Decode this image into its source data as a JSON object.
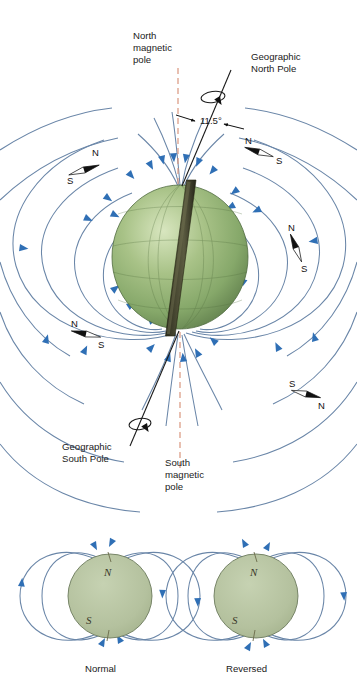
{
  "figure": {
    "title_visible": false,
    "background_color": "#ffffff",
    "colors": {
      "field_line": "#6a86a8",
      "field_arrow": "#2f6fb5",
      "magnetic_axis_dashed": "#d9967e",
      "geographic_axis": "#1a1a1a",
      "earth_green_light": "#cfe0b4",
      "earth_green_mid": "#8fb072",
      "earth_green_dark": "#5d7b4b",
      "bar_magnet_dark": "#3a3a28",
      "bar_magnet_light": "#55553c",
      "small_globe_fill": "#b6c3a0",
      "small_globe_stroke": "#6c7a5c",
      "text": "#1a1a1a"
    }
  },
  "main_diagram": {
    "labels": {
      "north_magnetic_pole": "North\nmagnetic\npole",
      "north_magnetic_pole_lines": [
        "North",
        "magnetic",
        "pole"
      ],
      "geographic_north_pole_lines": [
        "Geographic",
        "North Pole"
      ],
      "tilt_angle": "11.5°",
      "geographic_south_pole_lines": [
        "Geographic",
        "South Pole"
      ],
      "south_magnetic_pole_lines": [
        "South",
        "magnetic",
        "pole"
      ]
    },
    "compasses": [
      {
        "id": "compass-upper-left",
        "n_label": "N",
        "s_label": "S"
      },
      {
        "id": "compass-upper-right",
        "n_label": "N",
        "s_label": "S"
      },
      {
        "id": "compass-mid-right",
        "n_label": "N",
        "s_label": "S"
      },
      {
        "id": "compass-mid-left",
        "n_label": "N",
        "s_label": "S"
      },
      {
        "id": "compass-lower-right",
        "n_label": "N",
        "s_label": "S"
      }
    ]
  },
  "small_diagrams": [
    {
      "id": "normal-polarity",
      "caption": "Normal",
      "north_label": "N",
      "south_label": "S",
      "field_direction": "into-north-pole"
    },
    {
      "id": "reversed-polarity",
      "caption": "Reversed",
      "north_label": "N",
      "south_label": "S",
      "field_direction": "out-of-north-pole"
    }
  ]
}
